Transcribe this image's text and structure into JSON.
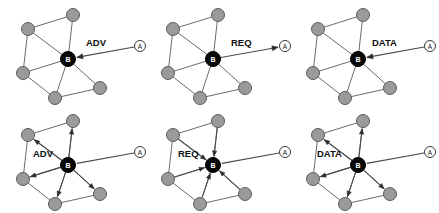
{
  "figure": {
    "name": "spin-protocol-handshake-figure",
    "width": 439,
    "height": 213,
    "background": "#ffffff",
    "node_colors": {
      "neighbor_fill": "#9a9a9a",
      "neighbor_stroke": "#5c5c5c",
      "source_fill": "#080808",
      "external_fill": "#ffffff",
      "external_stroke": "#3a3a3a",
      "edge_stroke": "#6b6b6b",
      "message_stroke": "#4a4a4a"
    },
    "node_labels": {
      "center": "B",
      "external": "A"
    },
    "panels": [
      {
        "id": "panel-1",
        "row": "top",
        "column": 1,
        "message_label": "ADV",
        "message_direction": "a-to-b",
        "broadcast": false,
        "label_x": 86,
        "label_y": 42,
        "origin_x": 0,
        "origin_y": 0
      },
      {
        "id": "panel-2",
        "row": "top",
        "column": 2,
        "message_label": "REQ",
        "message_direction": "b-to-a",
        "broadcast": false,
        "label_x": 86,
        "label_y": 42,
        "origin_x": 145,
        "origin_y": 0
      },
      {
        "id": "panel-3",
        "row": "top",
        "column": 3,
        "message_label": "DATA",
        "message_direction": "a-to-b",
        "broadcast": false,
        "label_x": 82,
        "label_y": 42,
        "origin_x": 290,
        "origin_y": 0
      },
      {
        "id": "panel-4",
        "row": "bottom",
        "column": 1,
        "message_label": "ADV",
        "message_direction": "none",
        "broadcast": true,
        "broadcast_direction": "outward",
        "label_x": 33,
        "label_y": 47,
        "origin_x": 0,
        "origin_y": 106
      },
      {
        "id": "panel-5",
        "row": "bottom",
        "column": 2,
        "message_label": "REQ",
        "message_direction": "none",
        "broadcast": true,
        "broadcast_direction": "inward",
        "label_x": 33,
        "label_y": 47,
        "origin_x": 145,
        "origin_y": 106
      },
      {
        "id": "panel-6",
        "row": "bottom",
        "column": 3,
        "message_label": "DATA",
        "message_direction": "none",
        "broadcast": true,
        "broadcast_direction": "outward",
        "label_x": 27,
        "label_y": 47,
        "origin_x": 290,
        "origin_y": 106
      }
    ],
    "graph": {
      "nodes": [
        {
          "id": "n-top",
          "label": "",
          "type": "neighbor",
          "x": 73,
          "y": 15,
          "r": 6.5
        },
        {
          "id": "n-upperleft",
          "label": "",
          "type": "neighbor",
          "x": 28,
          "y": 29,
          "r": 6.5
        },
        {
          "id": "n-left",
          "label": "",
          "type": "neighbor",
          "x": 23,
          "y": 73,
          "r": 6.5
        },
        {
          "id": "n-bottom",
          "label": "",
          "type": "neighbor",
          "x": 55,
          "y": 98,
          "r": 6.5
        },
        {
          "id": "n-right",
          "label": "",
          "type": "neighbor",
          "x": 100,
          "y": 88,
          "r": 6.5
        },
        {
          "id": "n-center",
          "label": "B",
          "type": "source",
          "x": 68,
          "y": 59,
          "r": 7.5
        },
        {
          "id": "n-external",
          "label": "A",
          "type": "external",
          "x": 140,
          "y": 46,
          "r": 5.5
        }
      ],
      "edges": [
        {
          "from": "n-upperleft",
          "to": "n-top"
        },
        {
          "from": "n-upperleft",
          "to": "n-left"
        },
        {
          "from": "n-upperleft",
          "to": "n-center"
        },
        {
          "from": "n-top",
          "to": "n-center"
        },
        {
          "from": "n-left",
          "to": "n-center"
        },
        {
          "from": "n-left",
          "to": "n-bottom"
        },
        {
          "from": "n-bottom",
          "to": "n-center"
        },
        {
          "from": "n-bottom",
          "to": "n-right"
        },
        {
          "from": "n-right",
          "to": "n-center"
        }
      ]
    }
  }
}
